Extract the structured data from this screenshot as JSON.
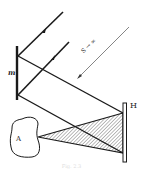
{
  "diagram": {
    "labels": {
      "mirror": "m",
      "hologram_plate": "H",
      "object": "A",
      "source": "S → ∞"
    },
    "caption": "Fig. 2.3",
    "colors": {
      "line": "#1a1a1a",
      "thin_line": "#666666",
      "hatch": "#555555",
      "background": "#ffffff"
    },
    "elements": [
      {
        "id": "mirror-m",
        "type": "plane mirror",
        "x": 17,
        "y1": 47,
        "y2": 99
      },
      {
        "id": "plate-H",
        "type": "hologram plate",
        "x": 124,
        "y1": 103,
        "y2": 162
      },
      {
        "id": "object-A",
        "type": "object (irregular blob)"
      },
      {
        "id": "incident-ray-1",
        "from": [
          62,
          13
        ],
        "to": [
          18,
          55
        ]
      },
      {
        "id": "incident-ray-2",
        "from": [
          68,
          43
        ],
        "to": [
          18,
          95
        ]
      },
      {
        "id": "reference-ray-1",
        "from": [
          18,
          55
        ],
        "to": [
          123,
          113
        ]
      },
      {
        "id": "reference-ray-2",
        "from": [
          18,
          95
        ],
        "to": [
          122,
          153
        ]
      },
      {
        "id": "object-beam",
        "type": "hatched triangle",
        "apex": [
          38,
          136
        ],
        "base": [
          [
            122,
            113
          ],
          [
            122,
            153
          ]
        ]
      },
      {
        "id": "source-direction",
        "from": [
          128,
          27
        ],
        "to": [
          78,
          78
        ]
      }
    ]
  }
}
